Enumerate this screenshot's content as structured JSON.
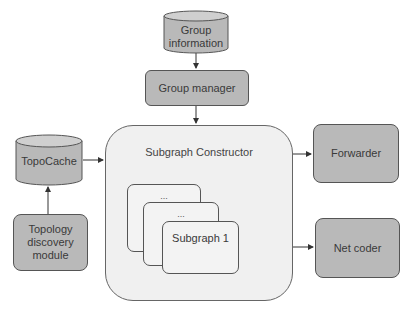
{
  "diagram": {
    "nodes": {
      "group_information": {
        "label_line1": "Group",
        "label_line2": "information",
        "shape": "cylinder"
      },
      "group_manager": {
        "label": "Group manager",
        "shape": "rounded-rect"
      },
      "subgraph_constructor": {
        "label": "Subgraph Constructor",
        "shape": "rounded-container"
      },
      "subgraph_back": {
        "label": "...",
        "shape": "rounded-rect"
      },
      "subgraph_middle": {
        "label": "...",
        "shape": "rounded-rect"
      },
      "subgraph_front": {
        "label": "Subgraph 1",
        "shape": "rounded-rect"
      },
      "topocache": {
        "label": "TopoCache",
        "shape": "cylinder"
      },
      "topology_discovery": {
        "label_line1": "Topology",
        "label_line2": "discovery",
        "label_line3": "module",
        "shape": "rounded-rect"
      },
      "forwarder": {
        "label": "Forwarder",
        "shape": "rounded-rect"
      },
      "net_coder": {
        "label": "Net coder",
        "shape": "rounded-rect"
      }
    },
    "edges": [
      {
        "from": "Group information",
        "to": "Group manager"
      },
      {
        "from": "Group manager",
        "to": "Subgraph Constructor"
      },
      {
        "from": "Topology discovery module",
        "to": "TopoCache"
      },
      {
        "from": "TopoCache",
        "to": "Subgraph Constructor"
      },
      {
        "from": "Subgraph Constructor",
        "to": "Forwarder"
      },
      {
        "from": "Subgraph Constructor",
        "to": "Net coder"
      }
    ],
    "colors": {
      "node_fill": "#b9b9b9",
      "container_fill": "#f0f0f0",
      "subgraph_fill": "#f3f3f3",
      "stroke": "#555555",
      "arrow": "#333333"
    }
  }
}
